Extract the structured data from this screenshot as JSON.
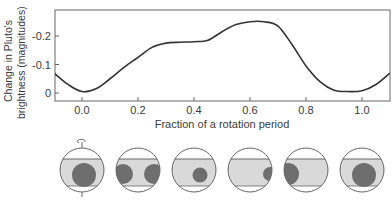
{
  "chart_data": {
    "type": "line",
    "title": "",
    "xlabel": "Fraction of a rotation period",
    "ylabel": "Change in Pluto's brightness (magnitudes)",
    "ylabel_lines": [
      "Change in Pluto's",
      "brightness (magnitudes)"
    ],
    "xlim": [
      -0.1,
      1.1
    ],
    "ylim": [
      0.03,
      -0.28
    ],
    "y_inverted": true,
    "grid": false,
    "legend": null,
    "x_ticks": [
      0.0,
      0.2,
      0.4,
      0.6,
      0.8,
      1.0
    ],
    "x_tick_labels": [
      "0.0",
      "0.2",
      "0.4",
      "0.6",
      "0.8",
      "1.0"
    ],
    "y_ticks": [
      -0.2,
      -0.1,
      0
    ],
    "y_tick_labels": [
      "-0.2",
      "-0.1",
      "0"
    ],
    "series": [
      {
        "name": "Pluto light curve",
        "x": [
          -0.1,
          -0.05,
          0.0,
          0.05,
          0.1,
          0.15,
          0.2,
          0.25,
          0.3,
          0.35,
          0.4,
          0.45,
          0.5,
          0.55,
          0.6,
          0.65,
          0.7,
          0.75,
          0.8,
          0.85,
          0.9,
          0.95,
          1.0,
          1.05,
          1.1
        ],
        "y": [
          -0.07,
          -0.03,
          -0.005,
          -0.015,
          -0.05,
          -0.09,
          -0.125,
          -0.16,
          -0.175,
          -0.178,
          -0.18,
          -0.185,
          -0.215,
          -0.24,
          -0.25,
          -0.25,
          -0.235,
          -0.17,
          -0.095,
          -0.04,
          -0.01,
          -0.005,
          -0.008,
          -0.03,
          -0.07
        ]
      }
    ],
    "annotations": [
      "Row of six Pluto globe diagrams below the x-axis at phases 0.0, 0.2, 0.4, 0.6, 0.8, 1.0 showing dark surface regions at different rotational positions"
    ]
  },
  "plot": {
    "frame": {
      "left": 55,
      "top": 10,
      "right": 390,
      "bottom": 101
    },
    "x_px_per_unit": 280,
    "x0_px": 82,
    "y_zero_px": 93,
    "y_px_per_unit": 285,
    "line_color": "#333333",
    "axis_color": "#666666"
  },
  "globes": {
    "center_y": 170,
    "radius": 22,
    "band_top_offset": -11,
    "band_bottom_offset": 16,
    "outline_color": "#666666",
    "band_color": "#d9d9d9",
    "spot_color": "#6e6e6e",
    "items": [
      {
        "phase": "0.0",
        "cx": 82,
        "spot": {
          "dx": 2,
          "dy": 5,
          "r": 12
        },
        "spot2": null,
        "axis_arrow": true
      },
      {
        "phase": "0.2",
        "cx": 138,
        "spot": {
          "dx": -15,
          "dy": 4,
          "r": 10
        },
        "spot2": {
          "dx": 16,
          "dy": 4,
          "r": 10
        },
        "axis_arrow": false
      },
      {
        "phase": "0.4",
        "cx": 194,
        "spot": {
          "dx": 6,
          "dy": 5,
          "r": 7.5
        },
        "spot2": null,
        "axis_arrow": false
      },
      {
        "phase": "0.6",
        "cx": 250,
        "spot": {
          "dx": 20,
          "dy": 4,
          "r": 7
        },
        "spot2": null,
        "axis_arrow": false
      },
      {
        "phase": "0.8",
        "cx": 306,
        "spot": {
          "dx": -18,
          "dy": 4,
          "r": 11
        },
        "spot2": null,
        "axis_arrow": false
      },
      {
        "phase": "1.0",
        "cx": 362,
        "spot": {
          "dx": 2,
          "dy": 5,
          "r": 12
        },
        "spot2": null,
        "axis_arrow": false
      }
    ]
  },
  "caption": {
    "text": ""
  }
}
